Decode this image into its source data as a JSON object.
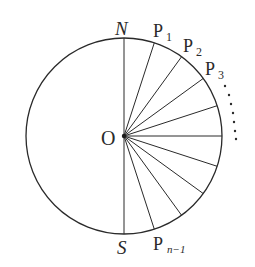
{
  "diagram": {
    "center": {
      "x": 124,
      "y": 136,
      "label": "O"
    },
    "radius": 98,
    "stroke_color": "#2a2a2a",
    "labels": {
      "north": "N",
      "south": "S",
      "p1": "P",
      "p1_sub": "1",
      "p2": "P",
      "p2_sub": "2",
      "p3": "P",
      "p3_sub": "3",
      "pn1": "P",
      "pn1_sub": "n−1",
      "origin": "O"
    },
    "spoke_angles_deg_from_north_clockwise": [
      0,
      18,
      36,
      54,
      72,
      90,
      108,
      126,
      144,
      162,
      180
    ],
    "ellipsis_dots": 7
  }
}
